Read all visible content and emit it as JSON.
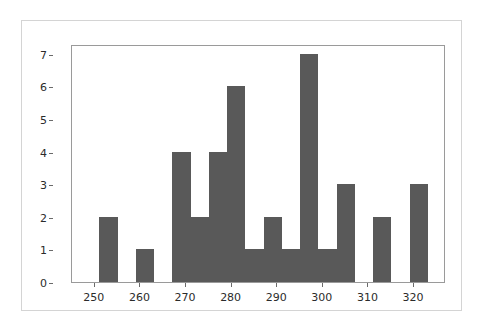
{
  "figure": {
    "background_color": "#ffffff",
    "frame_color": "#d4d4d4",
    "axes_color": "#9a9a9a"
  },
  "chart_data": {
    "type": "bar",
    "title": "",
    "subtitle": "",
    "xlabel": "",
    "ylabel": "",
    "legend": [],
    "grid": false,
    "bar_color": "#595959",
    "xlim": [
      245,
      327
    ],
    "ylim": [
      0,
      7.3
    ],
    "x_ticks": [
      250,
      260,
      270,
      280,
      290,
      300,
      310,
      320
    ],
    "x_tick_labels": [
      "250",
      "260",
      "270",
      "280",
      "290",
      "300",
      "310",
      "320"
    ],
    "y_ticks": [
      0,
      1,
      2,
      3,
      4,
      5,
      6,
      7
    ],
    "y_tick_labels": [
      "0",
      "1",
      "2",
      "3",
      "4",
      "5",
      "6",
      "7"
    ],
    "bin_width": 4,
    "bins": [
      {
        "left": 251,
        "right": 255,
        "center": 253,
        "value": 2
      },
      {
        "left": 259,
        "right": 263,
        "center": 261,
        "value": 1
      },
      {
        "left": 267,
        "right": 271,
        "center": 269,
        "value": 4
      },
      {
        "left": 271,
        "right": 275,
        "center": 273,
        "value": 2
      },
      {
        "left": 275,
        "right": 279,
        "center": 277,
        "value": 4
      },
      {
        "left": 279,
        "right": 283,
        "center": 281,
        "value": 6
      },
      {
        "left": 283,
        "right": 287,
        "center": 285,
        "value": 1
      },
      {
        "left": 287,
        "right": 291,
        "center": 289,
        "value": 2
      },
      {
        "left": 291,
        "right": 295,
        "center": 293,
        "value": 1
      },
      {
        "left": 295,
        "right": 299,
        "center": 297,
        "value": 7
      },
      {
        "left": 299,
        "right": 303,
        "center": 301,
        "value": 1
      },
      {
        "left": 303,
        "right": 307,
        "center": 305,
        "value": 3
      },
      {
        "left": 311,
        "right": 315,
        "center": 313,
        "value": 2
      },
      {
        "left": 319,
        "right": 323,
        "center": 321,
        "value": 3
      }
    ],
    "categories": [
      "253",
      "261",
      "269",
      "273",
      "277",
      "281",
      "285",
      "289",
      "293",
      "297",
      "301",
      "305",
      "313",
      "321"
    ],
    "values": [
      2,
      1,
      4,
      2,
      4,
      6,
      1,
      2,
      1,
      7,
      1,
      3,
      2,
      3
    ]
  }
}
